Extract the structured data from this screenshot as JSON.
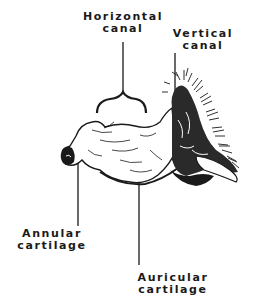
{
  "diagram": {
    "labels": {
      "horizontal_canal": {
        "line1": "Horizontal",
        "line2": "canal"
      },
      "vertical_canal": {
        "line1": "Vertical",
        "line2": "canal"
      },
      "annular_cartilage": {
        "line1": "Annular",
        "line2": "cartilage"
      },
      "auricular_cartilage": {
        "line1": "Auricular",
        "line2": "cartilage"
      }
    },
    "colors": {
      "ink": "#1a1a1a",
      "background": "#ffffff"
    }
  }
}
